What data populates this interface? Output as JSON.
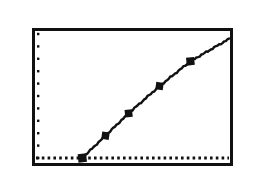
{
  "figure": {
    "title": "",
    "background_color": "#ffffff",
    "ink_color": "#111111"
  },
  "labels": {
    "y_axis_max": "300,000",
    "y_axis_min": "200,000",
    "x_axis_min": "60",
    "x_axis_max": "110"
  },
  "chart_data": {
    "type": "line",
    "title": "",
    "xlabel": "",
    "ylabel": "",
    "xlim": [
      60,
      110
    ],
    "ylim": [
      200000,
      300000
    ],
    "xticklabels": [
      "60",
      "110"
    ],
    "yticklabels": [
      "200,000",
      "300,000"
    ],
    "grid": false,
    "legend": null,
    "legend_position": "none",
    "annotations": [],
    "axis_tick_style": "dotted-inside-left-axis",
    "baseline": {
      "style": "dotted",
      "y_value": 200000,
      "description": "dotted horizontal reference line along the bottom of the plot area"
    },
    "series": [
      {
        "name": "series-1",
        "marker": "square",
        "line_style": "solid",
        "color": "#111111",
        "x": [
          72,
          78,
          84,
          92,
          100,
          110
        ],
        "y": [
          200000,
          218000,
          236000,
          258000,
          278000,
          296000
        ],
        "points": [
          {
            "x": 72,
            "y": 200000,
            "marker": true
          },
          {
            "x": 78,
            "y": 218000,
            "marker": true
          },
          {
            "x": 84,
            "y": 236000,
            "marker": true
          },
          {
            "x": 92,
            "y": 258000,
            "marker": true
          },
          {
            "x": 100,
            "y": 278000,
            "marker": true
          },
          {
            "x": 110,
            "y": 296000,
            "marker": false
          }
        ]
      }
    ]
  }
}
